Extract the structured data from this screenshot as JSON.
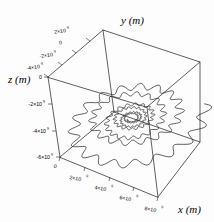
{
  "figure": {
    "kind": "3d-line-plot",
    "background_color": "#fdfdfd",
    "line_color": "#1a1a1a",
    "box_color": "#2a2a2a"
  },
  "axes": {
    "x": {
      "label": "x (m)",
      "label_name": "x-axis-label",
      "tick_labels": [
        "0",
        "2×10",
        "4×10",
        "6×10",
        "8×10"
      ],
      "tick_exponents": [
        "",
        "9",
        "9",
        "9",
        "9"
      ],
      "tick_values": [
        0,
        2000000000.0,
        4000000000.0,
        6000000000.0,
        8000000000.0
      ],
      "range": [
        -500000000.0,
        9000000000.0
      ],
      "unit": "m"
    },
    "y": {
      "label": "y (m)",
      "label_name": "y-axis-label",
      "tick_labels": [
        "2×10",
        "0",
        "-2×10",
        "-4×10"
      ],
      "tick_exponents": [
        "9",
        "",
        "9",
        "9"
      ],
      "tick_values": [
        2000000000.0,
        0,
        -2000000000.0,
        -4000000000.0
      ],
      "range": [
        -5000000000.0,
        3000000000.0
      ],
      "unit": "m"
    },
    "z": {
      "label": "z (m)",
      "label_name": "z-axis-label",
      "tick_labels": [
        "0",
        "-2×10",
        "-4×10",
        "-6×10"
      ],
      "tick_exponents": [
        "",
        "9",
        "9",
        "9"
      ],
      "tick_values": [
        0,
        -2000000000.0,
        -4000000000.0,
        -6000000000.0
      ],
      "range": [
        -7500000000.0,
        500000000.0
      ],
      "unit": "m"
    }
  },
  "chart_data": {
    "type": "line",
    "title": "",
    "xlabel": "x (m)",
    "ylabel": "y (m)",
    "zlabel": "z (m)",
    "grid": false,
    "legend": "none",
    "projection": "3d-orthographic-box",
    "xlim": [
      -500000000.0,
      9000000000.0
    ],
    "ylim": [
      -5000000000.0,
      3000000000.0
    ],
    "zlim": [
      -7500000000.0,
      500000000.0
    ],
    "xticks": [
      0,
      2000000000.0,
      4000000000.0,
      6000000000.0,
      8000000000.0
    ],
    "yticks": [
      -4000000000.0,
      -2000000000.0,
      0,
      2000000000.0
    ],
    "zticks": [
      -6000000000.0,
      -4000000000.0,
      -2000000000.0,
      0
    ],
    "exponent_base": 10,
    "exponent_power": 9,
    "series": [
      {
        "name": "trajectory",
        "color": "#1a1a1a",
        "spiral_turns": 6.5,
        "ripple_cycles_per_turn": 18,
        "start_radius_px": 74,
        "end_radius_px": 5,
        "ripple_amplitude_px": 7
      }
    ]
  }
}
